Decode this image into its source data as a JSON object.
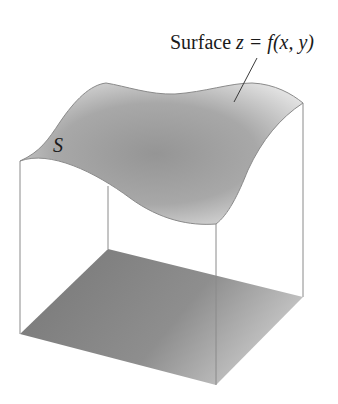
{
  "figure": {
    "surface_label": {
      "prefix": "Surface ",
      "equation": "z = f(x, y)"
    },
    "surface_symbol": "S",
    "colors": {
      "edge": "#8a8a8a",
      "surface_dark": "#959595",
      "surface_light": "#e4e4e4",
      "base_dark": "#7a7a7a",
      "base_light": "#cfcfcf",
      "text": "#1a1a1a"
    }
  }
}
